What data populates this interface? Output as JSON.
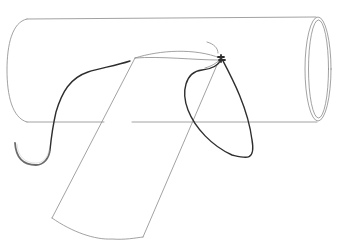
{
  "figure": {
    "description": "Line illustration of a tubular vessel with a strip graft sutured onto it, showing a suture loop and a curved surgical needle",
    "colors": {
      "outline": "#8a8a8a",
      "suture": "#2e2e2e",
      "needle": "#6b6b6b",
      "background": "#ffffff"
    },
    "elements": {
      "vessel": "cylinder",
      "vessel_opening": "open-end ellipse",
      "graft": "strip flap",
      "suture": "suture thread loop",
      "knot": "suture knot",
      "needle": "curved needle"
    }
  }
}
